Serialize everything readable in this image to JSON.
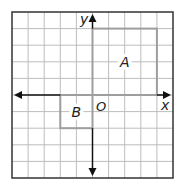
{
  "diagram": {
    "type": "coordinate-plane",
    "grid": {
      "columns": 10,
      "rows": 10,
      "x_min": -5,
      "x_max": 5,
      "y_min": -5,
      "y_max": 5
    },
    "axes": {
      "x_label": "x",
      "y_label": "y",
      "origin_label": "O"
    },
    "shapes": [
      {
        "label": "A",
        "type": "rectangle",
        "x_from": 0,
        "x_to": 4,
        "y_from": 0,
        "y_to": 4
      },
      {
        "label": "B",
        "type": "rectangle",
        "x_from": -2,
        "x_to": 0,
        "y_from": -2,
        "y_to": 0
      }
    ],
    "colors": {
      "grid": "#bdbdbd",
      "border": "#333333",
      "axis": "#111111",
      "shape": "#9e9e9e",
      "label": "#222222"
    }
  }
}
